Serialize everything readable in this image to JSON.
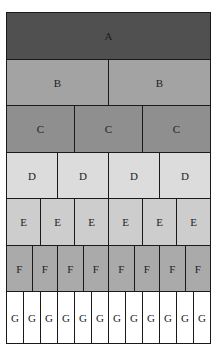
{
  "diagram": {
    "rows": [
      {
        "label": "A",
        "count": 1,
        "color": "#505050",
        "text_color": "#1e1e1e"
      },
      {
        "label": "B",
        "count": 2,
        "color": "#a3a3a3",
        "text_color": "#222222"
      },
      {
        "label": "C",
        "count": 3,
        "color": "#8f8f8f",
        "text_color": "#222222"
      },
      {
        "label": "D",
        "count": 4,
        "color": "#dcdcdc",
        "text_color": "#222222"
      },
      {
        "label": "E",
        "count": 6,
        "color": "#cdcdcd",
        "text_color": "#222222"
      },
      {
        "label": "F",
        "count": 8,
        "color": "#aaaaaa",
        "text_color": "#222222"
      },
      {
        "label": "G",
        "count": 12,
        "color": "#ffffff",
        "text_color": "#222222"
      }
    ]
  }
}
